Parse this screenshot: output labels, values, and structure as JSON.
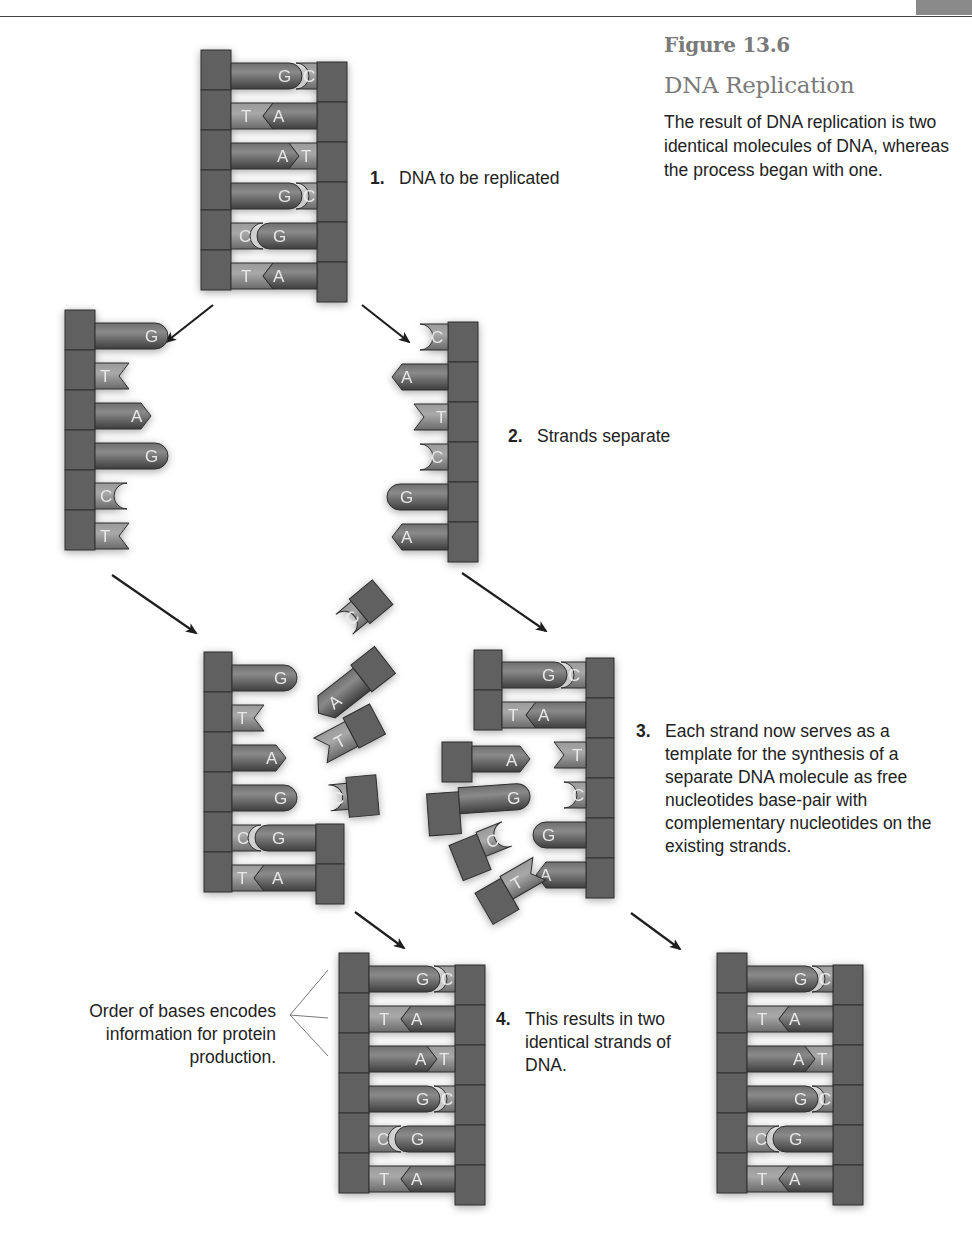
{
  "figure": {
    "number": "Figure 13.6",
    "title": "DNA Replication",
    "caption": "The result of DNA replication is two identical molecules of DNA, whereas the process began with one."
  },
  "steps": [
    {
      "number": "1.",
      "text": "DNA to be replicated"
    },
    {
      "number": "2.",
      "text": "Strands separate"
    },
    {
      "number": "3.",
      "text": "Each strand now serves as a template for the synthesis of a separate DNA molecule as free nucleotides base-pair with complementary nucleotides on the existing strands."
    },
    {
      "number": "4.",
      "text": "This results in two identical strands of DNA."
    }
  ],
  "annotation": {
    "text": "Order of bases encodes information for protein production."
  },
  "dna": {
    "left_strand_bases": [
      "G",
      "T",
      "A",
      "G",
      "C",
      "T"
    ],
    "right_strand_bases": [
      "C",
      "A",
      "T",
      "C",
      "G",
      "A"
    ],
    "base_pairs": [
      [
        "G",
        "C"
      ],
      [
        "T",
        "A"
      ],
      [
        "A",
        "T"
      ],
      [
        "G",
        "C"
      ],
      [
        "C",
        "G"
      ],
      [
        "T",
        "A"
      ]
    ]
  },
  "step3": {
    "left_template_paired": [
      "C-G",
      "T-A"
    ],
    "left_free_nucleotides": [
      "C",
      "A",
      "T",
      "C"
    ],
    "right_template_paired": [
      "G-C",
      "T-A"
    ],
    "right_free_nucleotides": [
      "A",
      "G",
      "C",
      "T"
    ]
  },
  "colors": {
    "backbone": "#5e5e5e",
    "base_dark": "#4a4a4a",
    "base_light": "#8c8c8c",
    "title_gray": "#7a7a7a",
    "text": "#222222",
    "arrow": "#1e1e1e"
  }
}
